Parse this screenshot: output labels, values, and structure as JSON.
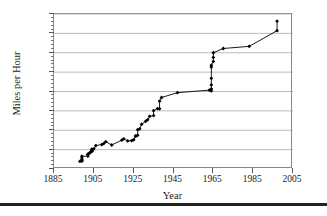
{
  "chart_data": {
    "type": "line",
    "title": "",
    "subtitle": "",
    "xlabel": "Year",
    "ylabel": "Miles per Hour",
    "xlim": [
      1885,
      2005
    ],
    "ylim": [
      0,
      800
    ],
    "x_ticks": [
      1885,
      1905,
      1925,
      1945,
      1965,
      1985,
      2005
    ],
    "y_ticks": [
      0,
      100,
      200,
      300,
      400,
      500,
      600,
      700,
      800
    ],
    "x_tick_labels": [
      "1885",
      "1905",
      "1925",
      "1945",
      "1965",
      "1985",
      "2005"
    ],
    "y_tick_labels": [
      "0",
      "100",
      "200",
      "300",
      "400",
      "500",
      "600",
      "700",
      "800"
    ],
    "x_minor_interval": 5,
    "y_minor_interval": 20,
    "grid": "horizontal",
    "legend": "none",
    "marker": "diamond",
    "marker_color": "#000000",
    "line_color": "#000000",
    "series": [
      {
        "name": "Land Speed Record",
        "points": [
          [
            1898,
            39
          ],
          [
            1899,
            41
          ],
          [
            1899,
            43
          ],
          [
            1899,
            49
          ],
          [
            1899,
            57
          ],
          [
            1899,
            66
          ],
          [
            1902,
            66
          ],
          [
            1902,
            74
          ],
          [
            1902,
            77
          ],
          [
            1903,
            84
          ],
          [
            1903,
            84
          ],
          [
            1904,
            91
          ],
          [
            1904,
            92
          ],
          [
            1904,
            94
          ],
          [
            1904,
            97
          ],
          [
            1904,
            103
          ],
          [
            1905,
            104
          ],
          [
            1906,
            121
          ],
          [
            1909,
            126
          ],
          [
            1910,
            131
          ],
          [
            1911,
            141
          ],
          [
            1914,
            124
          ],
          [
            1919,
            149
          ],
          [
            1920,
            156
          ],
          [
            1922,
            145
          ],
          [
            1924,
            146
          ],
          [
            1925,
            151
          ],
          [
            1926,
            169
          ],
          [
            1926,
            171
          ],
          [
            1927,
            174
          ],
          [
            1927,
            203
          ],
          [
            1928,
            207
          ],
          [
            1929,
            231
          ],
          [
            1931,
            246
          ],
          [
            1932,
            254
          ],
          [
            1933,
            272
          ],
          [
            1935,
            276
          ],
          [
            1935,
            301
          ],
          [
            1937,
            312
          ],
          [
            1938,
            311
          ],
          [
            1938,
            350
          ],
          [
            1939,
            369
          ],
          [
            1947,
            394
          ],
          [
            1963,
            407
          ],
          [
            1964,
            403
          ],
          [
            1964,
            413
          ],
          [
            1964,
            434
          ],
          [
            1964,
            468
          ],
          [
            1964,
            526
          ],
          [
            1964,
            536
          ],
          [
            1965,
            555
          ],
          [
            1965,
            576
          ],
          [
            1965,
            600
          ],
          [
            1970,
            622
          ],
          [
            1983,
            633
          ],
          [
            1997,
            714
          ],
          [
            1997,
            763
          ]
        ]
      }
    ],
    "annotations": []
  },
  "axis": {
    "y_title": "Miles per Hour",
    "x_title": "Year"
  }
}
